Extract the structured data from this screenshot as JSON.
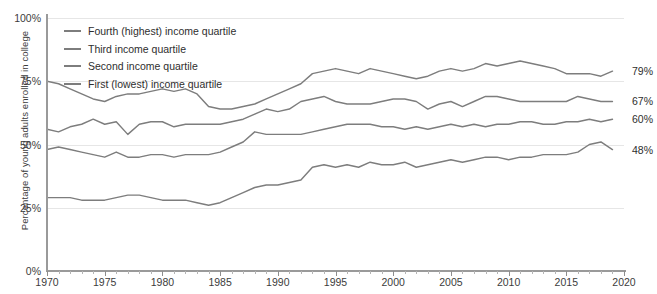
{
  "chart_data": {
    "type": "line",
    "title": "",
    "xlabel": "",
    "ylabel": "Percentage of young adults enrolled in college",
    "xlim": [
      1970,
      2020
    ],
    "ylim": [
      0,
      100
    ],
    "grid": true,
    "legend_position": "top-left",
    "y_ticks": [
      "0%",
      "25%",
      "50%",
      "75%",
      "100%"
    ],
    "y_tick_values": [
      0,
      25,
      50,
      75,
      100
    ],
    "x_ticks": [
      "1970",
      "1975",
      "1980",
      "1985",
      "1990",
      "1995",
      "2000",
      "2005",
      "2010",
      "2015",
      "2020"
    ],
    "x_tick_values": [
      1970,
      1975,
      1980,
      1985,
      1990,
      1995,
      2000,
      2005,
      2010,
      2015,
      2020
    ],
    "x": [
      1970,
      1971,
      1972,
      1973,
      1974,
      1975,
      1976,
      1977,
      1978,
      1979,
      1980,
      1981,
      1982,
      1983,
      1984,
      1985,
      1986,
      1987,
      1988,
      1989,
      1990,
      1991,
      1992,
      1993,
      1994,
      1995,
      1996,
      1997,
      1998,
      1999,
      2000,
      2001,
      2002,
      2003,
      2004,
      2005,
      2006,
      2007,
      2008,
      2009,
      2010,
      2011,
      2012,
      2013,
      2014,
      2015,
      2016,
      2017,
      2018,
      2019
    ],
    "series": [
      {
        "name": "Fourth (highest) income quartile",
        "color": "#7d7d7d",
        "end_label": "79%",
        "end_value": 79,
        "values": [
          75,
          74,
          72,
          70,
          68,
          67,
          69,
          70,
          70,
          71,
          72,
          71,
          72,
          70,
          65,
          64,
          64,
          65,
          66,
          68,
          70,
          72,
          74,
          78,
          79,
          80,
          79,
          78,
          80,
          79,
          78,
          77,
          76,
          77,
          79,
          80,
          79,
          80,
          82,
          81,
          82,
          83,
          82,
          81,
          80,
          78,
          78,
          78,
          77,
          79
        ]
      },
      {
        "name": "Third income quartile",
        "color": "#7d7d7d",
        "end_label": "67%",
        "end_value": 67,
        "values": [
          56,
          55,
          57,
          58,
          60,
          58,
          59,
          54,
          58,
          59,
          59,
          57,
          58,
          58,
          58,
          58,
          59,
          60,
          62,
          64,
          63,
          64,
          67,
          68,
          69,
          67,
          66,
          66,
          66,
          67,
          68,
          68,
          67,
          64,
          66,
          67,
          65,
          67,
          69,
          69,
          68,
          67,
          67,
          67,
          67,
          67,
          69,
          68,
          67,
          67
        ]
      },
      {
        "name": "Second income quartile",
        "color": "#7d7d7d",
        "end_label": "60%",
        "end_value": 60,
        "values": [
          48,
          49,
          48,
          47,
          46,
          45,
          47,
          45,
          45,
          46,
          46,
          45,
          46,
          46,
          46,
          47,
          49,
          51,
          55,
          54,
          54,
          54,
          54,
          55,
          56,
          57,
          58,
          58,
          58,
          57,
          57,
          56,
          57,
          56,
          57,
          58,
          57,
          58,
          57,
          58,
          58,
          59,
          59,
          58,
          58,
          59,
          59,
          60,
          59,
          60
        ]
      },
      {
        "name": "First (lowest) income quartile",
        "color": "#7d7d7d",
        "end_label": "48%",
        "end_value": 48,
        "values": [
          29,
          29,
          29,
          28,
          28,
          28,
          29,
          30,
          30,
          29,
          28,
          28,
          28,
          27,
          26,
          27,
          29,
          31,
          33,
          34,
          34,
          35,
          36,
          41,
          42,
          41,
          42,
          41,
          43,
          42,
          42,
          43,
          41,
          42,
          43,
          44,
          43,
          44,
          45,
          45,
          44,
          45,
          45,
          46,
          46,
          46,
          47,
          50,
          51,
          48
        ]
      }
    ]
  }
}
